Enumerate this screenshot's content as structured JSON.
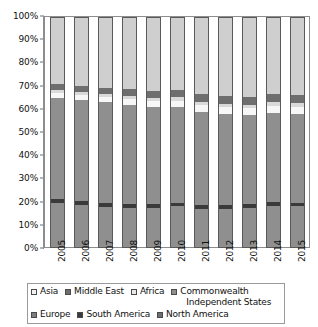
{
  "chart_data": {
    "type": "bar",
    "stacked": true,
    "normalized": true,
    "title": "",
    "xlabel": "",
    "ylabel": "",
    "ylim": [
      0,
      100
    ],
    "ytick_labels": [
      "100%",
      "90%",
      "80%",
      "70%",
      "60%",
      "50%",
      "40%",
      "30%",
      "20%",
      "10%",
      "0%"
    ],
    "ytick_values": [
      100,
      90,
      80,
      70,
      60,
      50,
      40,
      30,
      20,
      10,
      0
    ],
    "grid": false,
    "legend_position": "bottom",
    "categories": [
      "2005",
      "2006",
      "2007",
      "2008",
      "2009",
      "2010",
      "2011",
      "2012",
      "2013",
      "2014",
      "2015"
    ],
    "series": [
      {
        "name": "Asia",
        "color": "#8f8f8f",
        "legend_swatch": "#f2f2f2",
        "values": [
          19.5,
          18.6,
          17.8,
          17.5,
          17.2,
          18.0,
          17.0,
          16.8,
          17.2,
          18.4,
          18.0
        ]
      },
      {
        "name": "South America",
        "color": "#3a3a3a",
        "legend_swatch": "#3a3a3a",
        "values": [
          1.8,
          1.8,
          1.8,
          1.7,
          1.7,
          1.7,
          1.7,
          1.7,
          1.7,
          1.7,
          1.7
        ]
      },
      {
        "name": "Europe",
        "color": "#8f8f8f",
        "legend_swatch": "#7d7d7d",
        "values": [
          43.7,
          43.6,
          43.4,
          42.8,
          42.1,
          41.3,
          40.3,
          39.5,
          38.6,
          38.4,
          38.3
        ]
      },
      {
        "name": "Commonwealth Independent States",
        "color": "#f7f7f7",
        "legend_swatch": "#8f8f8f",
        "values": [
          2.2,
          2.3,
          2.4,
          2.5,
          2.6,
          2.7,
          2.8,
          2.9,
          3.0,
          3.0,
          3.1
        ]
      },
      {
        "name": "Africa",
        "color": "#d9d9d9",
        "legend_swatch": "#e8e8e8",
        "values": [
          1.2,
          1.3,
          1.3,
          1.4,
          1.4,
          1.5,
          1.5,
          1.6,
          1.6,
          1.7,
          1.7
        ]
      },
      {
        "name": "Middle East",
        "color": "#6e6e6e",
        "legend_swatch": "#6e6e6e",
        "values": [
          2.6,
          2.7,
          2.8,
          2.9,
          3.0,
          3.1,
          3.2,
          3.3,
          3.4,
          3.4,
          3.5
        ]
      },
      {
        "name": "North America",
        "color": "#cfcfcf",
        "legend_swatch": "#6e6e6e",
        "values": [
          29.0,
          29.7,
          30.5,
          31.2,
          32.0,
          31.7,
          33.5,
          34.2,
          34.5,
          33.4,
          33.7
        ]
      }
    ]
  },
  "legend": {
    "row1": [
      "Asia",
      "Middle East",
      "Africa"
    ],
    "cis_line1": "Commonwealth",
    "cis_line2": "Independent States",
    "row2": [
      "Europe",
      "South America",
      "North America"
    ]
  }
}
